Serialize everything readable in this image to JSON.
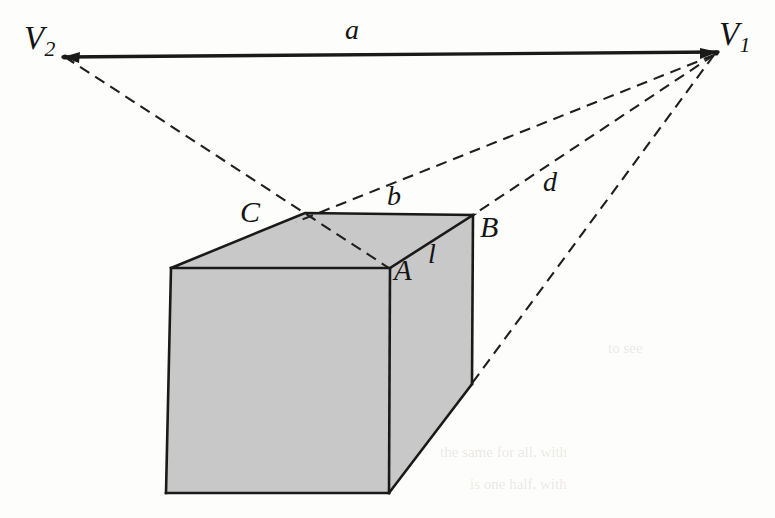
{
  "figure": {
    "background_color": "#fdfdfb",
    "ink_color": "#1a1a1a",
    "face_fill_color": "#c8c8c8",
    "labels": {
      "vanishing_point_left": {
        "text": "V",
        "subscript": "2"
      },
      "vanishing_point_right": {
        "text": "V",
        "subscript": "1"
      },
      "horizon_segment": "a",
      "top_back_edge": "b",
      "guide_to_lower_right": "d",
      "vertex_c": "C",
      "vertex_b": "B",
      "vertex_a": "A",
      "vertical_edge": "l"
    },
    "bleed_text": {
      "line_1": "to see",
      "line_2": "the same for all, with",
      "line_3": "is one half, with"
    }
  },
  "geometry": {
    "units": "pixels",
    "canvas": {
      "width": 775,
      "height": 518
    },
    "points": {
      "V2": [
        65,
        56
      ],
      "V1": [
        716,
        53
      ],
      "top_back_left": [
        305,
        213
      ],
      "top_left": [
        171,
        268
      ],
      "top_right_B": [
        473,
        215
      ],
      "top_front_A": [
        390,
        268
      ],
      "bottom_left": [
        166,
        493
      ],
      "bottom_front": [
        389,
        493
      ],
      "right_back_bottom": [
        472,
        384
      ],
      "guide_d_end": [
        472,
        384
      ]
    },
    "horizon_line": {
      "from": [
        65,
        56
      ],
      "to": [
        716,
        53
      ],
      "label": "a",
      "style": "solid"
    },
    "solid_edges": [
      {
        "from": [
          171,
          268
        ],
        "to": [
          305,
          213
        ],
        "name": "top-left-back-edge"
      },
      {
        "from": [
          305,
          213
        ],
        "to": [
          473,
          215
        ],
        "name": "top-back-edge-b"
      },
      {
        "from": [
          473,
          215
        ],
        "to": [
          390,
          268
        ],
        "name": "top-right-front-edge"
      },
      {
        "from": [
          390,
          268
        ],
        "to": [
          171,
          268
        ],
        "name": "top-front-edge"
      },
      {
        "from": [
          171,
          268
        ],
        "to": [
          166,
          493
        ],
        "name": "front-left-vertical"
      },
      {
        "from": [
          390,
          268
        ],
        "to": [
          389,
          493
        ],
        "name": "front-right-vertical"
      },
      {
        "from": [
          166,
          493
        ],
        "to": [
          389,
          493
        ],
        "name": "front-bottom-edge"
      },
      {
        "from": [
          473,
          215
        ],
        "to": [
          472,
          384
        ],
        "name": "right-back-vertical-l"
      },
      {
        "from": [
          389,
          493
        ],
        "to": [
          472,
          384
        ],
        "name": "right-bottom-edge"
      }
    ],
    "dashed_guides": [
      {
        "from": [
          65,
          56
        ],
        "to": [
          390,
          268
        ],
        "name": "v2-to-A",
        "via": [
          305,
          213
        ]
      },
      {
        "from": [
          716,
          53
        ],
        "to": [
          299,
          220
        ],
        "name": "v1-to-top-back-left"
      },
      {
        "from": [
          716,
          53
        ],
        "to": [
          473,
          215
        ],
        "name": "v1-to-B",
        "label": "d"
      },
      {
        "from": [
          716,
          53
        ],
        "to": [
          472,
          384
        ],
        "name": "v1-to-right-back-bottom"
      }
    ]
  }
}
